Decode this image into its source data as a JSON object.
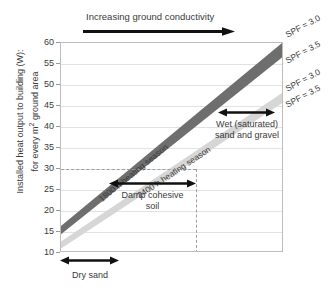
{
  "chart_data": {
    "type": "line",
    "title": "",
    "xlabel": "",
    "ylabel": "Installed heat output to building (W): for every m² ground area",
    "ylim": [
      10,
      60
    ],
    "yticks": [
      10,
      15,
      20,
      25,
      30,
      35,
      40,
      45,
      50,
      55,
      60
    ],
    "grid": true,
    "legend_position": "right-outside",
    "x_axis_note": "Increasing ground conductivity (no numeric scale)",
    "series": [
      {
        "name": "1800 h heating season",
        "shade": "dark grey band",
        "color": "#6e6e6e",
        "bound_upper": {
          "name": "SPF = 3.0",
          "y_left": 16.0,
          "y_right": 60.0
        },
        "bound_lower": {
          "name": "SPF = 3.5",
          "y_left": 14.0,
          "y_right": 56.5
        }
      },
      {
        "name": "2400 h heating season",
        "shade": "light grey band",
        "color": "#d6d6d6",
        "bound_upper": {
          "name": "SPF = 3.0",
          "y_left": 12.3,
          "y_right": 48.0
        },
        "bound_lower": {
          "name": "SPF = 3.5",
          "y_left": 10.6,
          "y_right": 45.5
        }
      }
    ],
    "reference_lines": [
      {
        "orientation": "horizontal",
        "value": 30,
        "style": "dashed",
        "color": "#9e9e9e"
      },
      {
        "orientation": "vertical",
        "position_frac": 0.605,
        "style": "dashed",
        "color": "#9e9e9e"
      }
    ],
    "annotations": [
      {
        "text": "Increasing ground conductivity",
        "arrow": "right",
        "position": "above-plot"
      },
      {
        "text": "Dry sand",
        "arrow": "double",
        "position": "below-axis-left"
      },
      {
        "text": "Damp cohesive soil",
        "arrow": "double",
        "position": "inside-lower-middle"
      },
      {
        "text": "Wet (saturated) sand and gravel",
        "arrow": "double",
        "position": "inside-right"
      }
    ],
    "curve_labels": [
      "SPF = 3.0",
      "SPF = 3.5",
      "SPF = 3.0",
      "SPF = 3.5"
    ]
  },
  "axis": {
    "ylabel_line1": "Installed heat output to building (W):",
    "ylabel_line2": "for every m",
    "ylabel_sup": "2",
    "ylabel_line2b": " ground area",
    "yticks": [
      "60",
      "55",
      "50",
      "45",
      "40",
      "35",
      "30",
      "25",
      "20",
      "15",
      "10"
    ]
  },
  "labels": {
    "top_arrow": "Increasing ground conductivity",
    "band_dark": "1800 h heating season",
    "band_light": "2400 h heating season",
    "spf_1": "SPF = 3.0",
    "spf_2": "SPF = 3.5",
    "spf_3": "SPF = 3.0",
    "spf_4": "SPF = 3.5",
    "dry_sand": "Dry sand",
    "damp_line1": "Damp cohesive",
    "damp_line2": "soil",
    "wet_line1": "Wet (saturated)",
    "wet_line2": "sand and gravel"
  },
  "colors": {
    "band_dark": "#6e6e6e",
    "band_light": "#d6d6d6",
    "grid": "#e2e2e2",
    "frame": "#bdbdbd",
    "dash": "#9e9e9e",
    "text": "#3a3a3a",
    "arrow": "#111111"
  }
}
